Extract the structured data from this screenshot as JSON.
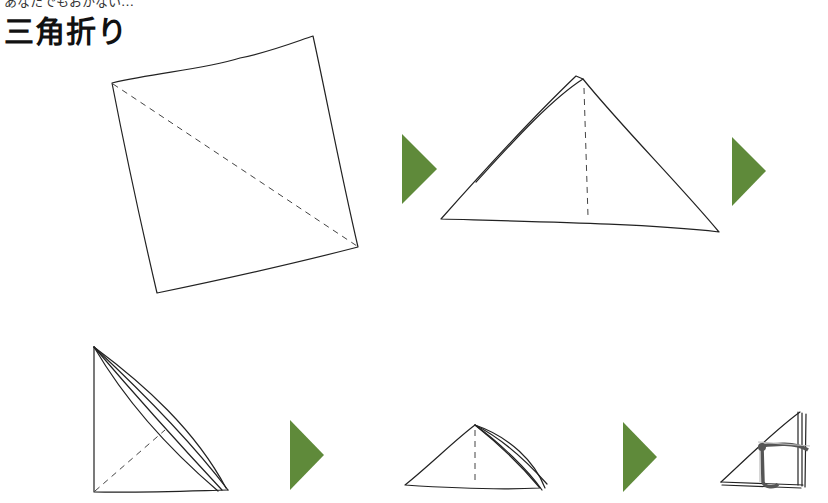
{
  "header": {
    "cut_off_text": "あなたでもおかない…",
    "title": "三角折り"
  },
  "steps": [
    {
      "index": 1,
      "icon": "square-cloth-diagonal-fold-icon"
    },
    {
      "index": 2,
      "icon": "triangle-cloth-center-fold-icon"
    },
    {
      "index": 3,
      "icon": "folded-right-triangle-icon"
    },
    {
      "index": 4,
      "icon": "folded-small-triangle-icon"
    },
    {
      "index": 5,
      "icon": "tied-triangle-bundle-icon"
    }
  ],
  "arrows": {
    "color": "#5f8a3a",
    "items": [
      {
        "name": "step-arrow-1"
      },
      {
        "name": "step-arrow-2"
      },
      {
        "name": "step-arrow-3"
      },
      {
        "name": "step-arrow-4"
      }
    ]
  }
}
